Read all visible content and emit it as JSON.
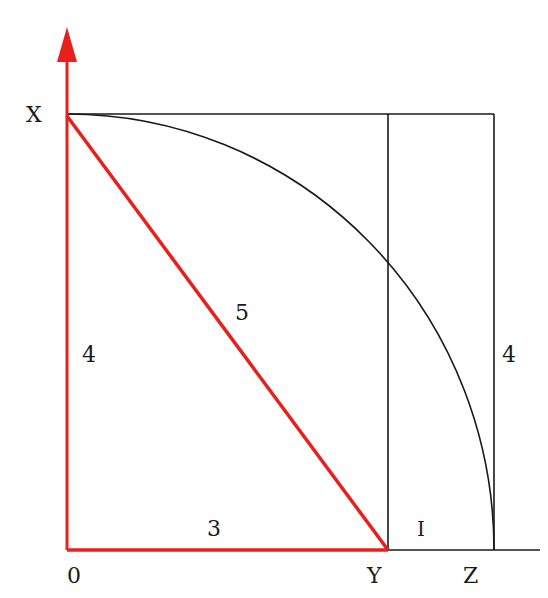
{
  "diagram": {
    "points": {
      "origin": "0",
      "top": "X",
      "mid": "Y",
      "right": "Z"
    },
    "lengths": {
      "vertical_leg": "4",
      "hypotenuse": "5",
      "base": "3",
      "gap": "I",
      "right_side": "4"
    },
    "colors": {
      "triangle": "#e8201c",
      "lines": "#1a1a1a",
      "background": "#ffffff"
    }
  }
}
